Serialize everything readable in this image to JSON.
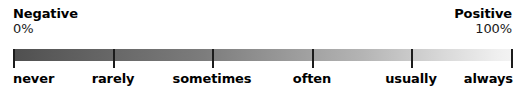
{
  "figure": {
    "name": "likert-frequency-gradient-scale",
    "background_color": "#ffffff",
    "bar": {
      "gradient_from_color": "#4f4f4f",
      "gradient_to_color": "#f3f3f3",
      "tick_color": "#1c1c1c"
    }
  },
  "endpoints": {
    "left": {
      "title": "Negative",
      "value": "0%"
    },
    "right": {
      "title": "Positive",
      "value": "100%"
    }
  },
  "anchors": [
    {
      "label": "never",
      "percent": "0%",
      "align": "start"
    },
    {
      "label": "rarely",
      "percent": "20%",
      "align": "mid"
    },
    {
      "label": "sometimes",
      "percent": "40%",
      "align": "mid"
    },
    {
      "label": "often",
      "percent": "60%",
      "align": "mid"
    },
    {
      "label": "usually",
      "percent": "80%",
      "align": "mid"
    },
    {
      "label": "always",
      "percent": "100%",
      "align": "end"
    }
  ],
  "chart_data": {
    "type": "bar",
    "title": "",
    "xlabel": "",
    "ylabel": "",
    "categories": [
      "never",
      "rarely",
      "sometimes",
      "often",
      "usually",
      "always"
    ],
    "values": [
      0,
      20,
      40,
      60,
      80,
      100
    ],
    "tick_positions_px": [
      13,
      113,
      212,
      312,
      411,
      511
    ],
    "xlim": [
      0,
      100
    ],
    "grid": false,
    "legend": null,
    "annotations": [
      "Negative 0%",
      "Positive 100%"
    ]
  }
}
